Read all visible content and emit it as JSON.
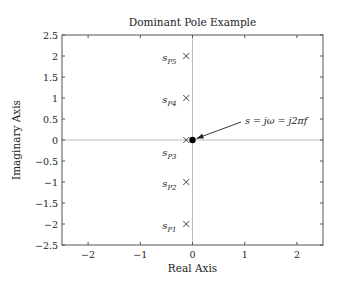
{
  "chart_data": {
    "type": "scatter",
    "title": "Dominant Pole Example",
    "xlabel": "Real Axis",
    "ylabel": "Imaginary Axis",
    "xlim": [
      -2.5,
      2.5
    ],
    "ylim": [
      -2.5,
      2.5
    ],
    "xticks": [
      -2,
      -1,
      0,
      1,
      2
    ],
    "xtick_labels": [
      "−2",
      "−1",
      "0",
      "1",
      "2"
    ],
    "yticks": [
      2.5,
      2,
      1.5,
      1,
      0.5,
      0,
      -0.5,
      -1,
      -1.5,
      -2,
      -2.5
    ],
    "ytick_labels": [
      "2.5",
      "2",
      "1.5",
      "1",
      "0.5",
      "0",
      "−0.5",
      "−1",
      "−1.5",
      "−2",
      "−2.5"
    ],
    "grid": false,
    "zero_lines": true,
    "series": [
      {
        "name": "poles",
        "marker": "x",
        "points": [
          {
            "x": -0.12,
            "y": 2,
            "label": "s",
            "sub": "P5"
          },
          {
            "x": -0.12,
            "y": 1,
            "label": "s",
            "sub": "P4"
          },
          {
            "x": -0.12,
            "y": 0,
            "label": "s",
            "sub": "P3"
          },
          {
            "x": -0.12,
            "y": -1,
            "label": "s",
            "sub": "P2"
          },
          {
            "x": -0.12,
            "y": -2,
            "label": "s",
            "sub": "P1"
          }
        ]
      },
      {
        "name": "evaluation point",
        "marker": "filled-circle",
        "points": [
          {
            "x": 0,
            "y": 0
          }
        ]
      }
    ],
    "annotations": [
      {
        "text": "s = jω = j2πf",
        "xy": [
          0,
          0
        ],
        "xytext": [
          0.35,
          0.2
        ],
        "arrow": true
      }
    ]
  }
}
